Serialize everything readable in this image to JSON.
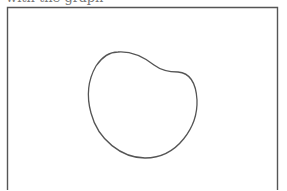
{
  "caption": {
    "text": "with the graph",
    "note_visible": "partially cut off at top edge"
  },
  "figure": {
    "frame": {
      "x": 7,
      "y": 7,
      "width": 270,
      "height": 190,
      "stroke": "#555555",
      "stroke_width": 1.4,
      "bottom_border_visible": false
    },
    "shape": {
      "type": "closed-blob",
      "description": "kidney/bean-shaped closed curve",
      "stroke": "#555555",
      "stroke_width": 1.3,
      "fill": "none",
      "path": "M 118 52 C 132 51, 145 58, 154 65 C 162 71, 170 72, 178 72 C 190 73, 196 82, 197 100 C 198 126, 178 158, 145 158 C 122 158, 98 140, 91 113 C 86 95, 88 80, 96 66 C 102 57, 110 52, 118 52 Z"
    }
  }
}
